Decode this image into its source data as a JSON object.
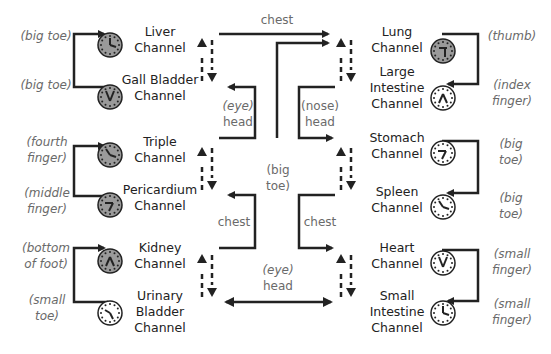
{
  "diagram": {
    "type": "meridian-channel-clock-diagram",
    "left_column": [
      {
        "channel": "Liver Channel",
        "line1": "Liver",
        "line2": "Channel",
        "point": "(big toe)",
        "clock": "shaded"
      },
      {
        "channel": "Gall Bladder Channel",
        "line1": "Gall Bladder",
        "line2": "Channel",
        "point": "(big toe)",
        "clock": "shaded"
      },
      {
        "channel": "Triple Channel",
        "line1": "Triple",
        "line2": "Channel",
        "point_line1": "(fourth",
        "point_line2": "finger)",
        "clock": "shaded"
      },
      {
        "channel": "Pericardium Channel",
        "line1": "Pericardium",
        "line2": "Channel",
        "point_line1": "(middle",
        "point_line2": "finger)",
        "clock": "shaded"
      },
      {
        "channel": "Kidney Channel",
        "line1": "Kidney",
        "line2": "Channel",
        "point_line1": "(bottom",
        "point_line2": "of foot)",
        "clock": "shaded"
      },
      {
        "channel": "Urinary Bladder Channel",
        "line1": "Urinary",
        "line2": "Bladder",
        "line3": "Channel",
        "point_line1": "(small",
        "point_line2": "toe)",
        "clock": "white"
      }
    ],
    "right_column": [
      {
        "channel": "Lung Channel",
        "line1": "Lung",
        "line2": "Channel",
        "point": "(thumb)",
        "clock": "shaded"
      },
      {
        "channel": "Large Intestine Channel",
        "line1": "Large",
        "line2": "Intestine",
        "line3": "Channel",
        "point_line1": "(index",
        "point_line2": "finger)",
        "clock": "white"
      },
      {
        "channel": "Stomach Channel",
        "line1": "Stomach",
        "line2": "Channel",
        "point_line1": "(big",
        "point_line2": "toe)",
        "clock": "white"
      },
      {
        "channel": "Spleen Channel",
        "line1": "Spleen",
        "line2": "Channel",
        "point_line1": "(big",
        "point_line2": "toe)",
        "clock": "white"
      },
      {
        "channel": "Heart Channel",
        "line1": "Heart",
        "line2": "Channel",
        "point_line1": "(small",
        "point_line2": "finger)",
        "clock": "white"
      },
      {
        "channel": "Small Intestine Channel",
        "line1": "Small",
        "line2": "Intestine",
        "line3": "Channel",
        "point_line1": "(small",
        "point_line2": "finger)",
        "clock": "white"
      }
    ],
    "center_labels": {
      "top_chest": "chest",
      "left_eye_1": "(eye)",
      "left_head_1": "head",
      "right_nose": "(nose)",
      "right_head_1": "head",
      "big": "(big",
      "toe": "toe)",
      "left_chest": "chest",
      "right_chest": "chest",
      "bottom_eye": "(eye)",
      "bottom_head": "head"
    },
    "colors": {
      "line": "#222222",
      "clock_shaded": "#9a9a9a",
      "clock_white": "#ffffff",
      "note_text": "#6a6a6a"
    }
  }
}
